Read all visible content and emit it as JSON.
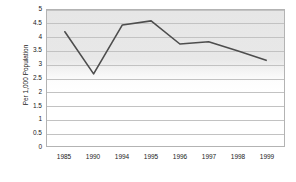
{
  "chart_data": {
    "type": "line",
    "title": "",
    "xlabel": "",
    "ylabel": "Per 1,000 Population",
    "categories": [
      "1985",
      "1990",
      "1994",
      "1995",
      "1996",
      "1997",
      "1998",
      "1999"
    ],
    "values": [
      4.2,
      2.65,
      4.45,
      4.6,
      3.75,
      3.83,
      3.5,
      3.15
    ],
    "series": [
      {
        "name": "Rate per 1,000 population",
        "values": [
          4.2,
          2.65,
          4.45,
          4.6,
          3.75,
          3.83,
          3.5,
          3.15
        ]
      }
    ],
    "ylim": [
      0,
      5
    ],
    "ytick_step": 0.5,
    "yticks": [
      "0",
      "0.5",
      "1",
      "1.5",
      "2",
      "2.5",
      "3",
      "3.5",
      "4",
      "4.5",
      "5"
    ],
    "grid": true,
    "grid_axis": "y",
    "legend": false,
    "legend_position": "none",
    "line_color": "#4d4d4d",
    "plot_background_top": "#e6e6e6",
    "plot_background_bottom": "#ffffff",
    "grid_color": "#c2c2c2",
    "axis_border_color": "#b3b3b3",
    "text_color": "#1a1a1a"
  }
}
